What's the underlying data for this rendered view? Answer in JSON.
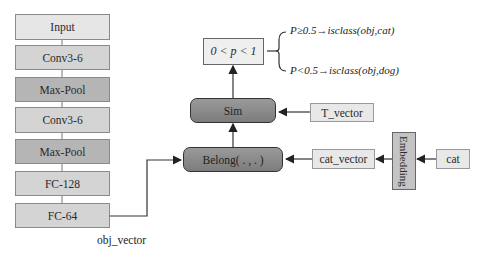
{
  "network": {
    "layers": [
      {
        "label": "Input",
        "tone": "light"
      },
      {
        "label": "Conv3-6",
        "tone": "mid"
      },
      {
        "label": "Max-Pool",
        "tone": "dark"
      },
      {
        "label": "Conv3-6",
        "tone": "mid"
      },
      {
        "label": "Max-Pool",
        "tone": "dark"
      },
      {
        "label": "FC-128",
        "tone": "mid"
      },
      {
        "label": "FC-64",
        "tone": "mid"
      }
    ],
    "output_label": "obj_vector"
  },
  "ops": {
    "sim": "Sim",
    "belong": "Belong( . , . )"
  },
  "vectors": {
    "t_vector": "T_vector",
    "cat_vector": "cat_vector",
    "cat": "cat",
    "embedding": "Embedding"
  },
  "probability": {
    "range": "0 < p < 1",
    "rules": [
      "P≥0.5→isclass(obj,cat)",
      "P<0.5→isclass(obj,dog)"
    ]
  },
  "colors": {
    "light": "#e6e6e6",
    "mid": "#d4d4d4",
    "dark": "#b5b5b5",
    "op": "#888888",
    "line": "#333333"
  }
}
